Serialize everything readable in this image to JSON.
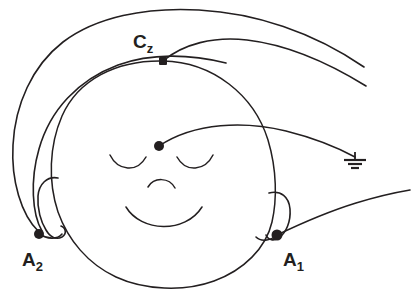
{
  "figure": {
    "subject_view": "frontal face, eyes closed",
    "background_color": "#ffffff",
    "ink_color": "#231f20"
  },
  "labels": {
    "vertex": {
      "base": "C",
      "sub": "z",
      "full": "Cz"
    },
    "right_ear": {
      "base": "A",
      "sub": "1",
      "full": "A1"
    },
    "left_ear": {
      "base": "A",
      "sub": "2",
      "full": "A2"
    }
  },
  "electrodes": [
    {
      "name": "vertex-electrode",
      "label": "Cz",
      "marker": "square",
      "x": 163,
      "y": 61
    },
    {
      "name": "ground-electrode",
      "label": "",
      "marker": "dot",
      "x": 159,
      "y": 146
    },
    {
      "name": "left-ear-electrode",
      "label": "A2",
      "marker": "dot",
      "x": 39,
      "y": 234
    },
    {
      "name": "right-ear-electrode",
      "label": "A1",
      "marker": "dot",
      "x": 277,
      "y": 235
    }
  ],
  "icons": {
    "earth_ground": "earth-ground-icon",
    "electrode_square": "electrode-square-icon",
    "electrode_dot": "electrode-dot-icon"
  },
  "face_features": [
    "left-eye-closed-arc",
    "right-eye-closed-arc",
    "nose-arc",
    "smiling-mouth-arc",
    "left-ear-helix",
    "right-ear-helix"
  ],
  "leads": [
    {
      "name": "cz-lead-wire",
      "from": "Cz",
      "exit": "right-edge-upper"
    },
    {
      "name": "a2-outer-lead-wire",
      "from": "A2",
      "exit": "right-edge-top"
    },
    {
      "name": "a2-inner-lead-wire",
      "from": "A2",
      "exit": "over-vertex"
    },
    {
      "name": "ground-lead-wire",
      "from": "ground-electrode",
      "exit": "earth-ground-symbol"
    },
    {
      "name": "a1-lead-wire",
      "from": "A1",
      "exit": "right-edge-lower"
    }
  ]
}
